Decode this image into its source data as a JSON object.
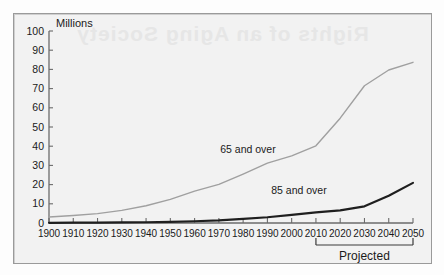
{
  "figure": {
    "unit_label": "Millions",
    "projected_label": "Projected",
    "bleed_through_text": "Rights of an Aging Society"
  },
  "chart_data": {
    "type": "line",
    "title": "",
    "xlabel": "",
    "ylabel": "Millions",
    "xlim": [
      1900,
      2050
    ],
    "ylim": [
      0,
      100
    ],
    "ytick_step": 10,
    "grid": false,
    "legend_position": "inline-annotation",
    "x": [
      1900,
      1910,
      1920,
      1930,
      1940,
      1950,
      1960,
      1970,
      1980,
      1990,
      2000,
      2010,
      2020,
      2030,
      2040,
      2050
    ],
    "xtick_labels": [
      "1900",
      "1910",
      "1920",
      "1930",
      "1940",
      "1950",
      "1960",
      "1970",
      "1980",
      "1990",
      "2000",
      "2010",
      "2020",
      "2030",
      "2040",
      "2050"
    ],
    "ytick_labels": [
      "0",
      "10",
      "20",
      "30",
      "40",
      "50",
      "60",
      "70",
      "80",
      "90",
      "100"
    ],
    "series": [
      {
        "name": "65 and over",
        "label": "65 and over",
        "color": "#a0a0a0",
        "width": 1.4,
        "values": [
          3.1,
          3.9,
          4.9,
          6.6,
          9.0,
          12.3,
          16.6,
          20.1,
          25.5,
          31.2,
          35.0,
          40.2,
          54.6,
          71.5,
          79.7,
          83.7
        ]
      },
      {
        "name": "85 and over",
        "label": "85 and over",
        "color": "#1f1f1f",
        "width": 2.2,
        "values": [
          0.1,
          0.2,
          0.2,
          0.3,
          0.4,
          0.6,
          0.9,
          1.4,
          2.2,
          3.0,
          4.2,
          5.5,
          6.6,
          8.7,
          14.2,
          20.9
        ]
      }
    ],
    "annotations": [
      {
        "text": "65 and over",
        "x": 1982,
        "y": 36.5
      },
      {
        "text": "85 and over",
        "x": 2003,
        "y": 15.0
      },
      {
        "text": "Projected",
        "x": 2032,
        "y": -17.0
      }
    ],
    "projected_range": [
      2010,
      2050
    ]
  }
}
